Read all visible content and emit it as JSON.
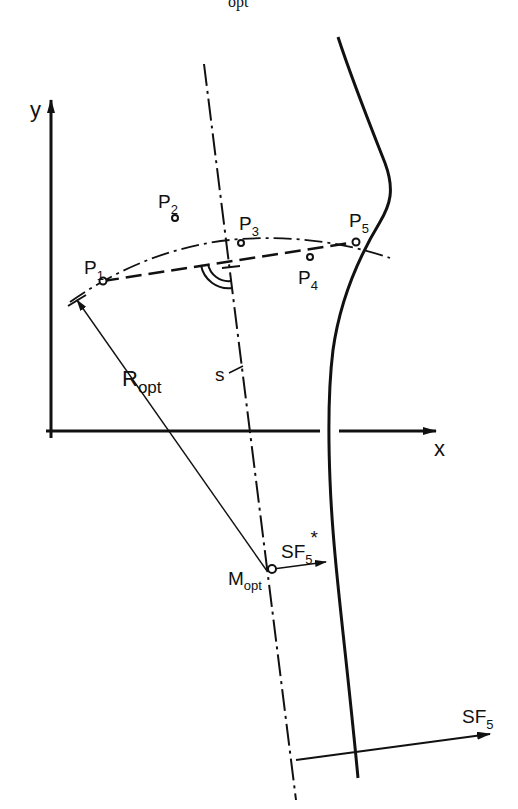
{
  "figure": {
    "top_caption_fragment": "opt",
    "axes": {
      "x_label": "x",
      "y_label": "y"
    },
    "points": [
      {
        "id": "P1",
        "base": "P",
        "sub": "1",
        "x": 103,
        "y": 281
      },
      {
        "id": "P2",
        "base": "P",
        "sub": "2",
        "x": 175,
        "y": 218
      },
      {
        "id": "P3",
        "base": "P",
        "sub": "3",
        "x": 241,
        "y": 243
      },
      {
        "id": "P4",
        "base": "P",
        "sub": "4",
        "x": 310,
        "y": 257
      },
      {
        "id": "P5",
        "base": "P",
        "sub": "5",
        "x": 356,
        "y": 242
      }
    ],
    "labels": {
      "radius": {
        "base": "R",
        "sub": "opt"
      },
      "center": {
        "base": "M",
        "sub": "opt"
      },
      "bisector": "s",
      "sf5_star": {
        "base": "SF",
        "sub": "5",
        "sup": "*"
      },
      "sf5": {
        "base": "SF",
        "sub": "5"
      }
    },
    "line_styles": {
      "chord": "dashed",
      "arc": "dash-dot",
      "bisector": "dash-dot",
      "profile": "solid",
      "radius": "thin solid"
    },
    "stroke_color": "#111111"
  }
}
